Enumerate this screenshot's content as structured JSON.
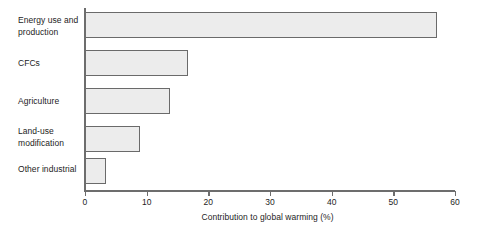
{
  "chart_data": {
    "type": "bar",
    "orientation": "horizontal",
    "title": "",
    "xlabel": "Contribution to global warming (%)",
    "ylabel": "",
    "xlim": [
      0,
      60
    ],
    "xticks": [
      0,
      10,
      20,
      30,
      40,
      50,
      60
    ],
    "xtick_labels": [
      "0",
      "10",
      "20",
      "30",
      "40",
      "50",
      "60"
    ],
    "grid": false,
    "legend": false,
    "categories": [
      "Energy use and production",
      "CFCs",
      "Agriculture",
      "Land-use modification",
      "Other industrial"
    ],
    "values": [
      57,
      16.7,
      13.8,
      8.9,
      3.4
    ],
    "bar_fill_color": "#ececec",
    "bar_border_color": "#6a6a6a",
    "axis_color": "#6d6d6d",
    "text_color": "#1d1d1d",
    "background_color": "#ffffff"
  },
  "labels": {
    "cat0_line1": "Energy use and",
    "cat0_line2": "production",
    "cat1_line1": "CFCs",
    "cat2_line1": "Agriculture",
    "cat3_line1": "Land-use",
    "cat3_line2": "modification",
    "cat4_line1": "Other industrial"
  }
}
